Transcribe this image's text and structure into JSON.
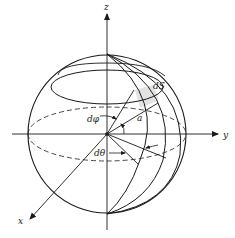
{
  "figure": {
    "colors": {
      "line": "#1a1a1a",
      "patch": "#e3e3e3",
      "background": "#ffffff"
    },
    "labels": {
      "z_axis": "z",
      "y_axis": "y",
      "x_axis": "x",
      "surface_element": "dS",
      "d_phi": "dφ",
      "d_theta": "dθ",
      "radius": "a"
    }
  }
}
